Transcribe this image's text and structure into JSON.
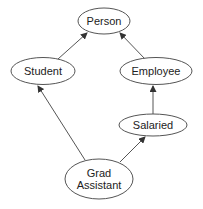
{
  "diagram": {
    "type": "inheritance-hierarchy",
    "colors": {
      "stroke": "#555555",
      "text": "#222222",
      "background": "#ffffff"
    },
    "nodes": [
      {
        "id": "person",
        "label": "Person",
        "lines": [
          "Person"
        ],
        "cx": 104,
        "cy": 21,
        "rx": 26,
        "ry": 13
      },
      {
        "id": "student",
        "label": "Student",
        "lines": [
          "Student"
        ],
        "cx": 43,
        "cy": 71,
        "rx": 32,
        "ry": 13.5
      },
      {
        "id": "employee",
        "label": "Employee",
        "lines": [
          "Employee"
        ],
        "cx": 156,
        "cy": 71,
        "rx": 36,
        "ry": 13.5
      },
      {
        "id": "salaried",
        "label": "Salaried",
        "lines": [
          "Salaried"
        ],
        "cx": 153,
        "cy": 125,
        "rx": 34,
        "ry": 11
      },
      {
        "id": "grad-assistant",
        "label": "Grad Assistant",
        "lines": [
          "Grad",
          "Assistant"
        ],
        "cx": 99,
        "cy": 179,
        "rx": 34,
        "ry": 20
      }
    ],
    "edges": [
      {
        "from": "student",
        "to": "person",
        "x1": 58,
        "y1": 59,
        "x2": 87,
        "y2": 33
      },
      {
        "from": "employee",
        "to": "person",
        "x1": 145,
        "y1": 59,
        "x2": 120,
        "y2": 33
      },
      {
        "from": "salaried",
        "to": "employee",
        "x1": 153,
        "y1": 114,
        "x2": 153,
        "y2": 86
      },
      {
        "from": "grad-assistant",
        "to": "student",
        "x1": 85,
        "y1": 160,
        "x2": 38,
        "y2": 86
      },
      {
        "from": "grad-assistant",
        "to": "salaried",
        "x1": 120,
        "y1": 162,
        "x2": 145,
        "y2": 137
      }
    ]
  }
}
